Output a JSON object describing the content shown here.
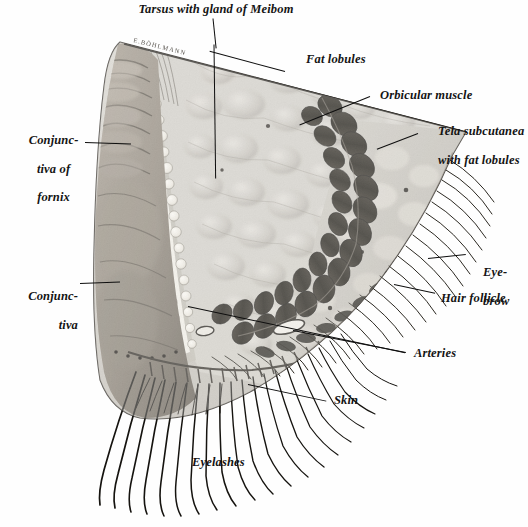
{
  "figure": {
    "kind": "anatomical-illustration",
    "style": "halftone engraving, grayscale",
    "background_color": "#fefefe",
    "ink_color": "#0e0e0e",
    "signature": "E. BÖHLMANN"
  },
  "labels": {
    "tarsus": "Tarsus with gland of Meibom",
    "fat_lobules": "Fat lobules",
    "orbicular_muscle": "Orbicular muscle",
    "tela_subcutanea_line1": "Tela subcutanea",
    "tela_subcutanea_line2": "with fat lobules",
    "conjunctiva_fornix_line1": "Conjunc-",
    "conjunctiva_fornix_line2": "tiva of",
    "conjunctiva_fornix_line3": "fornix",
    "conjunctiva_line1": "Conjunc-",
    "conjunctiva_line2": "tiva",
    "eyebrow_line1": "Eye-",
    "eyebrow_line2": "brow",
    "hair_follicle": "Hair follicle",
    "arteries": "Arteries",
    "skin": "Skin",
    "eyelashes": "Eyelashes"
  },
  "palette": {
    "background": "#fefefe",
    "ink": "#0e0e0e",
    "tarsus_pale": "#d9d6cf",
    "fat_tissue": "#c9c6bf",
    "fat_lobule_fill": "#b6b3ab",
    "muscle_dark": "#17140f",
    "muscle_mid": "#3a352c",
    "conjunctiva_mid": "#8c8377",
    "conjunctiva_dark": "#5d564c",
    "skin_tone": "#9c948a",
    "meibomian_light": "#efece4",
    "lash_color": "#15130f"
  },
  "structures": [
    {
      "name": "tarsus-with-meibomian-glands",
      "note": "vertical pale gland column with acini"
    },
    {
      "name": "fat-lobules",
      "note": "pale polygonal lobules filling the upper wedge"
    },
    {
      "name": "orbicular-muscle",
      "note": "arc of dark muscle bundles in cross-section"
    },
    {
      "name": "tela-subcutanea",
      "note": "subcutaneous tissue with fat lobules, right of muscle arc"
    },
    {
      "name": "conjunctiva-of-fornix",
      "note": "folded mucosa at the left margin"
    },
    {
      "name": "conjunctiva",
      "note": "smooth mucosal surface at the lower left"
    },
    {
      "name": "eyebrow-hairs",
      "note": "fine hairs fanning off the upper right margin"
    },
    {
      "name": "hair-follicles",
      "note": "follicles along the skin border"
    },
    {
      "name": "arteries",
      "note": "two small vessel lumina within the lid"
    },
    {
      "name": "skin",
      "note": "outer dermal border along the lower right"
    },
    {
      "name": "eyelashes",
      "note": "long curved cilia sweeping down-left from the lid margin"
    }
  ]
}
